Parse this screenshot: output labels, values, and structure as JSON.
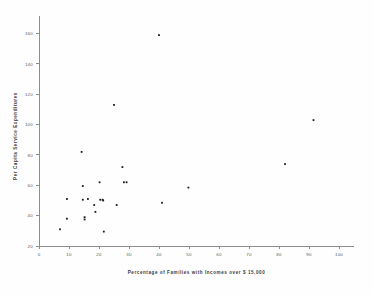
{
  "figure": {
    "background": "#ffffff",
    "point_color": "#1a1a1a",
    "axis_color": "#8d8d8d"
  },
  "chart_data": {
    "type": "scatter",
    "title": "",
    "subtitle": "",
    "xlabel": "Percentage  of  Families with Incomes over $ 15,000",
    "ylabel": "Per Capita Service Expenditures",
    "xlim": [
      0,
      105
    ],
    "ylim": [
      20,
      165
    ],
    "xticks": [
      0,
      10,
      20,
      30,
      40,
      50,
      60,
      70,
      80,
      90,
      100
    ],
    "xticklabels": [
      "0",
      "10",
      "20",
      "30",
      "40",
      "50",
      "60",
      "70",
      "80",
      "90",
      "100"
    ],
    "yticks": [
      20,
      40,
      60,
      80,
      100,
      120,
      140,
      160
    ],
    "yticklabels": [
      "20",
      "40",
      "60",
      "80",
      "100",
      "120",
      "140",
      "160"
    ],
    "grid": false,
    "legend": null,
    "marker": "dot",
    "n_points": 29,
    "series": [
      {
        "name": "observations",
        "points": [
          [
            7.0,
            31.0
          ],
          [
            9.3,
            51.0
          ],
          [
            9.3,
            38.0
          ],
          [
            14.2,
            82.0
          ],
          [
            14.6,
            59.5
          ],
          [
            14.6,
            50.5
          ],
          [
            15.2,
            39.0
          ],
          [
            15.2,
            37.5
          ],
          [
            16.3,
            51.0
          ],
          [
            18.4,
            47.0
          ],
          [
            18.8,
            42.5
          ],
          [
            20.2,
            62.0
          ],
          [
            20.4,
            50.5
          ],
          [
            21.2,
            50.5
          ],
          [
            21.4,
            50.0
          ],
          [
            21.6,
            29.5
          ],
          [
            25.0,
            113.0
          ],
          [
            25.9,
            47.0
          ],
          [
            27.8,
            72.0
          ],
          [
            28.3,
            62.0
          ],
          [
            29.2,
            62.0
          ],
          [
            40.0,
            159.0
          ],
          [
            41.0,
            48.5
          ],
          [
            49.8,
            58.5
          ],
          [
            82.0,
            74.0
          ],
          [
            91.5,
            103.0
          ]
        ]
      }
    ]
  },
  "caption": {
    "text": ""
  }
}
